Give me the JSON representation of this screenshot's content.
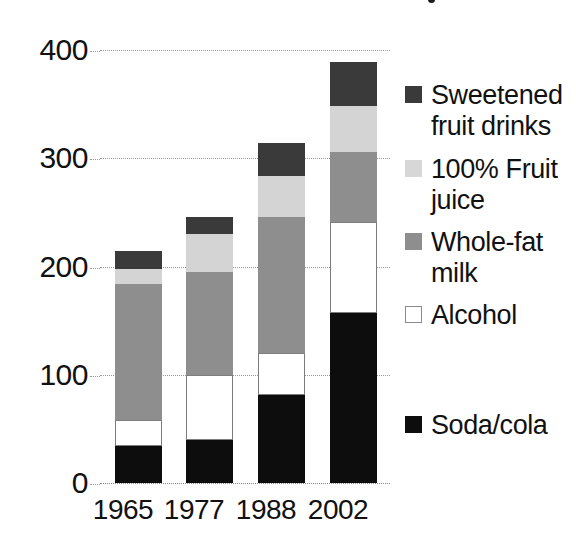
{
  "chart_data": {
    "type": "bar",
    "stacked": true,
    "title": "",
    "subtitle": "",
    "xlabel": "",
    "ylabel": "",
    "ylim": [
      0,
      400
    ],
    "ytick_labels": [
      "0",
      "100",
      "200",
      "300",
      "400"
    ],
    "yticks": [
      0,
      100,
      200,
      300,
      400
    ],
    "grid": true,
    "grid_style": "dotted horizontal",
    "legend_position": "right",
    "categories": [
      "1965",
      "1977",
      "1988",
      "2002"
    ],
    "series": [
      {
        "name": "Soda/cola",
        "color": "#0d0d0d",
        "values": [
          34,
          40,
          81,
          157
        ]
      },
      {
        "name": "Alcohol",
        "color": "#ffffff",
        "values": [
          24,
          60,
          39,
          84
        ]
      },
      {
        "name": "Whole-fat milk",
        "color": "#8e8e8e",
        "values": [
          126,
          95,
          126,
          65
        ]
      },
      {
        "name": "100% Fruit juice",
        "color": "#d4d4d4",
        "values": [
          14,
          35,
          38,
          42
        ]
      },
      {
        "name": "Sweetened fruit drinks",
        "color": "#3a3a3a",
        "values": [
          16,
          16,
          30,
          41
        ]
      }
    ],
    "stack_order_bottom_to_top": [
      "Soda/cola",
      "Alcohol",
      "Whole-fat milk",
      "100% Fruit juice",
      "Sweetened fruit drinks"
    ],
    "totals": [
      214,
      246,
      314,
      389
    ],
    "annotations": []
  },
  "axis": {
    "y_labels": [
      {
        "text": "400",
        "value": 400
      },
      {
        "text": "300",
        "value": 300
      },
      {
        "text": "200",
        "value": 200
      },
      {
        "text": "100",
        "value": 100
      },
      {
        "text": "0",
        "value": 0
      }
    ],
    "x_labels": [
      "1965",
      "1977",
      "1988",
      "2002"
    ]
  },
  "legend": {
    "items": [
      {
        "label": "Sweetened fruit drinks",
        "swatch": "sweet",
        "color": "#3a3a3a"
      },
      {
        "label": "100% Fruit juice",
        "swatch": "juice",
        "color": "#d7d7d7"
      },
      {
        "label": "Whole-fat milk",
        "swatch": "milk",
        "color": "#8e8e8e"
      },
      {
        "label": "Alcohol",
        "swatch": "alcohol",
        "color": "#ffffff"
      },
      {
        "label": "Soda/cola",
        "swatch": "soda",
        "color": "#0d0d0d"
      }
    ]
  }
}
